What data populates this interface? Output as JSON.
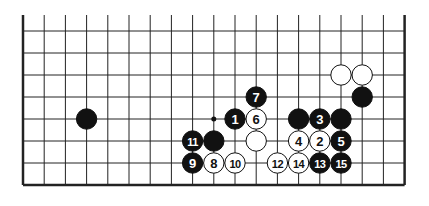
{
  "diagram": {
    "type": "go-board-diagram",
    "grid": {
      "columns": 19,
      "rows_visible": 8,
      "top_edge_open": true,
      "origin_x": 23,
      "origin_y": 31,
      "spacing_x": 21.2,
      "spacing_y": 22,
      "line_color": "#222222",
      "edge_width": 2.5,
      "line_width": 1
    },
    "colors": {
      "black": "#111111",
      "white": "#ffffff",
      "outline": "#111111"
    },
    "markers": [
      {
        "col": 9,
        "row": 4,
        "type": "dot"
      }
    ],
    "stones": [
      {
        "col": 3,
        "row": 4,
        "color": "black",
        "label": ""
      },
      {
        "col": 15,
        "row": 2,
        "color": "white",
        "label": ""
      },
      {
        "col": 16,
        "row": 2,
        "color": "white",
        "label": ""
      },
      {
        "col": 16,
        "row": 3,
        "color": "black",
        "label": ""
      },
      {
        "col": 11,
        "row": 3,
        "color": "black",
        "label": "7"
      },
      {
        "col": 10,
        "row": 4,
        "color": "black",
        "label": "1"
      },
      {
        "col": 11,
        "row": 4,
        "color": "white",
        "label": "6"
      },
      {
        "col": 13,
        "row": 4,
        "color": "black",
        "label": ""
      },
      {
        "col": 14,
        "row": 4,
        "color": "black",
        "label": "3"
      },
      {
        "col": 15,
        "row": 4,
        "color": "black",
        "label": ""
      },
      {
        "col": 8,
        "row": 5,
        "color": "black",
        "label": "11"
      },
      {
        "col": 9,
        "row": 5,
        "color": "black",
        "label": ""
      },
      {
        "col": 11,
        "row": 5,
        "color": "white",
        "label": ""
      },
      {
        "col": 13,
        "row": 5,
        "color": "white",
        "label": "4"
      },
      {
        "col": 14,
        "row": 5,
        "color": "white",
        "label": "2"
      },
      {
        "col": 15,
        "row": 5,
        "color": "black",
        "label": "5"
      },
      {
        "col": 8,
        "row": 6,
        "color": "black",
        "label": "9"
      },
      {
        "col": 9,
        "row": 6,
        "color": "white",
        "label": "8"
      },
      {
        "col": 10,
        "row": 6,
        "color": "white",
        "label": "10"
      },
      {
        "col": 12,
        "row": 6,
        "color": "white",
        "label": "12"
      },
      {
        "col": 13,
        "row": 6,
        "color": "white",
        "label": "14"
      },
      {
        "col": 14,
        "row": 6,
        "color": "black",
        "label": "13"
      },
      {
        "col": 15,
        "row": 6,
        "color": "black",
        "label": "15"
      }
    ]
  }
}
